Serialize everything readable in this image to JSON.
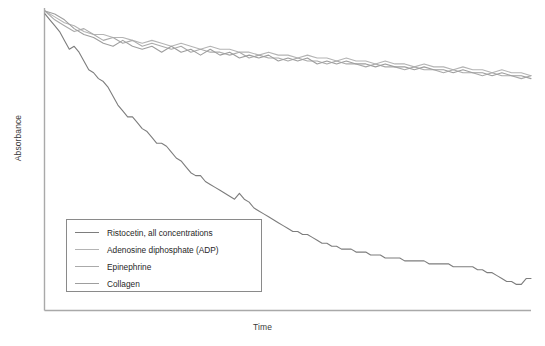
{
  "chart_data": {
    "type": "line",
    "title": "",
    "xlabel": "Time",
    "ylabel": "Absorbance",
    "grid": false,
    "legend_position": "lower-left",
    "xlim": [
      0,
      100
    ],
    "ylim": [
      0,
      100
    ],
    "axis_ticks": {
      "x": [],
      "y": []
    },
    "series": [
      {
        "name": "Ristocetin, all concentrations",
        "color": "#7d7d7d",
        "x": [
          0,
          1,
          2,
          3,
          4,
          5,
          6,
          7,
          8,
          9,
          10,
          11,
          12,
          13,
          14,
          15,
          16,
          17,
          18,
          19,
          20,
          21,
          22,
          23,
          24,
          25,
          26,
          27,
          28,
          29,
          30,
          31,
          32,
          33,
          34,
          35,
          36,
          37,
          38,
          39,
          40,
          41,
          42,
          43,
          44,
          45,
          46,
          47,
          48,
          49,
          50,
          51,
          52,
          53,
          54,
          55,
          56,
          57,
          58,
          59,
          60,
          61,
          62,
          63,
          64,
          65,
          66,
          67,
          68,
          69,
          70,
          71,
          72,
          73,
          74,
          75,
          76,
          77,
          78,
          79,
          80,
          81,
          82,
          83,
          84,
          85,
          86,
          87,
          88,
          89,
          90,
          91,
          92,
          93,
          94,
          95,
          96,
          97,
          98,
          99,
          100
        ],
        "y": [
          99,
          97,
          95,
          93,
          90,
          87,
          88,
          86,
          83,
          80,
          79,
          77,
          76,
          74,
          71,
          68,
          66,
          64,
          64,
          62,
          60,
          59,
          57,
          55,
          55,
          54,
          52,
          50,
          49,
          47,
          45,
          44,
          44,
          42,
          41,
          40,
          39,
          38,
          37,
          36,
          38,
          36,
          35,
          33,
          32,
          31,
          30,
          29,
          28,
          27,
          26,
          25,
          25,
          24,
          24,
          23,
          22,
          21,
          21,
          20,
          20,
          19,
          19,
          19,
          18,
          18,
          18,
          17,
          17,
          17,
          16,
          16,
          16,
          16,
          15,
          15,
          15,
          15,
          15,
          14,
          14,
          14,
          14,
          14,
          13,
          13,
          13,
          13,
          13,
          12,
          12,
          11,
          11,
          10,
          9,
          8,
          8,
          7,
          7,
          9,
          9
        ]
      },
      {
        "name": "Adenosine diphosphate (ADP)",
        "color": "#b4b4b4",
        "x": [
          0,
          2,
          4,
          6,
          8,
          10,
          12,
          14,
          16,
          18,
          20,
          22,
          24,
          26,
          28,
          30,
          32,
          34,
          36,
          38,
          40,
          42,
          44,
          46,
          48,
          50,
          52,
          54,
          56,
          58,
          60,
          62,
          64,
          66,
          68,
          70,
          72,
          74,
          76,
          78,
          80,
          82,
          84,
          86,
          88,
          90,
          92,
          94,
          96,
          98,
          100
        ],
        "y": [
          100,
          98,
          96,
          95,
          93,
          92,
          92,
          91,
          91,
          90,
          89,
          90,
          89,
          88,
          89,
          88,
          87,
          88,
          87,
          87,
          86,
          86,
          85,
          86,
          85,
          85,
          84,
          85,
          84,
          84,
          83,
          84,
          83,
          83,
          82,
          83,
          82,
          82,
          81,
          82,
          81,
          81,
          80,
          81,
          80,
          80,
          79,
          80,
          79,
          79,
          78
        ]
      },
      {
        "name": "Epinephrine",
        "color": "#aaaaaa",
        "x": [
          0,
          2,
          4,
          6,
          8,
          10,
          12,
          14,
          16,
          18,
          20,
          22,
          24,
          26,
          28,
          30,
          32,
          34,
          36,
          38,
          40,
          42,
          44,
          46,
          48,
          50,
          52,
          54,
          56,
          58,
          60,
          62,
          64,
          66,
          68,
          70,
          72,
          74,
          76,
          78,
          80,
          82,
          84,
          86,
          88,
          90,
          92,
          94,
          96,
          98,
          100
        ],
        "y": [
          100,
          97,
          95,
          93,
          94,
          92,
          90,
          91,
          89,
          90,
          88,
          89,
          88,
          87,
          88,
          86,
          87,
          86,
          86,
          85,
          86,
          84,
          85,
          84,
          84,
          83,
          84,
          83,
          83,
          82,
          83,
          82,
          82,
          81,
          82,
          81,
          81,
          80,
          81,
          80,
          80,
          79,
          80,
          79,
          79,
          78,
          79,
          78,
          78,
          77,
          78
        ]
      },
      {
        "name": "Collagen",
        "color": "#9e9e9e",
        "x": [
          0,
          2,
          4,
          6,
          8,
          10,
          12,
          14,
          16,
          18,
          20,
          22,
          24,
          26,
          28,
          30,
          32,
          34,
          36,
          38,
          40,
          42,
          44,
          46,
          48,
          50,
          52,
          54,
          56,
          58,
          60,
          62,
          64,
          66,
          68,
          70,
          72,
          74,
          76,
          78,
          80,
          82,
          84,
          86,
          88,
          90,
          92,
          94,
          96,
          98,
          100
        ],
        "y": [
          100,
          99,
          97,
          94,
          92,
          91,
          89,
          88,
          90,
          88,
          87,
          88,
          86,
          88,
          86,
          87,
          85,
          87,
          85,
          86,
          84,
          85,
          84,
          85,
          83,
          84,
          83,
          84,
          82,
          83,
          82,
          83,
          82,
          82,
          81,
          82,
          81,
          81,
          80,
          81,
          80,
          80,
          79,
          80,
          79,
          79,
          78,
          79,
          78,
          78,
          77
        ]
      }
    ]
  },
  "legend": {
    "entries": [
      {
        "label": "Ristocetin, all concentrations",
        "color": "#7d7d7d"
      },
      {
        "label": "Adenosine diphosphate (ADP)",
        "color": "#b4b4b4"
      },
      {
        "label": "Epinephrine",
        "color": "#aaaaaa"
      },
      {
        "label": "Collagen",
        "color": "#9e9e9e"
      }
    ]
  },
  "axes": {
    "x_title": "Time",
    "y_title": "Absorbance",
    "axis_color": "#a9a9a9"
  }
}
